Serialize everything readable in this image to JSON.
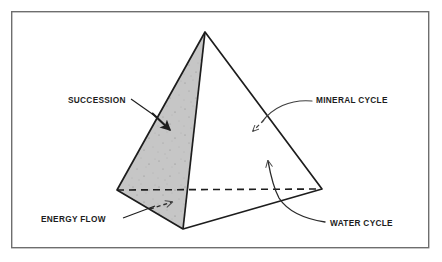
{
  "figure": {
    "background_color": "#ffffff",
    "frame": {
      "border_color": "#6e6e6e",
      "border_width": 1.4,
      "x": 11,
      "y": 11,
      "width": 418,
      "height": 237
    }
  },
  "diagram": {
    "type": "tetrahedron-pyramid",
    "line_color": "#1d1d1d",
    "shaded_face_color": "#c6c6c6",
    "unshaded_face_color": "#ffffff",
    "speckle_color": "#8a8a8a",
    "vertices": {
      "apex": {
        "x": 205,
        "y": 32
      },
      "left": {
        "x": 117,
        "y": 190
      },
      "right": {
        "x": 322,
        "y": 189
      },
      "front": {
        "x": 183,
        "y": 229
      }
    },
    "hidden_base_edge": {
      "style": "dashed",
      "from": "left",
      "to": "right"
    },
    "faces": [
      {
        "name": "left-face-succession",
        "shaded": true,
        "points": "apex,left,front"
      },
      {
        "name": "right-face-open",
        "shaded": false,
        "points": "apex,front,right"
      },
      {
        "name": "base-face-energy-flow",
        "shaded": true,
        "points": "left,front,right-dashed"
      }
    ]
  },
  "labels": {
    "succession": {
      "text": "SUCCESSION",
      "x": 68,
      "y": 103,
      "anchor": "start",
      "leader": "solid-arrow",
      "arrow_target": {
        "x": 167,
        "y": 128
      }
    },
    "mineral_cycle": {
      "text": "MINERAL CYCLE",
      "x": 316,
      "y": 103,
      "anchor": "start",
      "leader": "curved-dashed-arrow",
      "arrow_target": {
        "x": 251,
        "y": 133
      }
    },
    "energy_flow": {
      "text": "ENERGY FLOW",
      "x": 41,
      "y": 222,
      "anchor": "start",
      "leader": "solid-dashed-arrow",
      "arrow_target": {
        "x": 173,
        "y": 203
      }
    },
    "water_cycle": {
      "text": "WATER CYCLE",
      "x": 330,
      "y": 226,
      "anchor": "start",
      "leader": "curved-solid-arrow",
      "arrow_target": {
        "x": 268,
        "y": 158
      }
    }
  }
}
